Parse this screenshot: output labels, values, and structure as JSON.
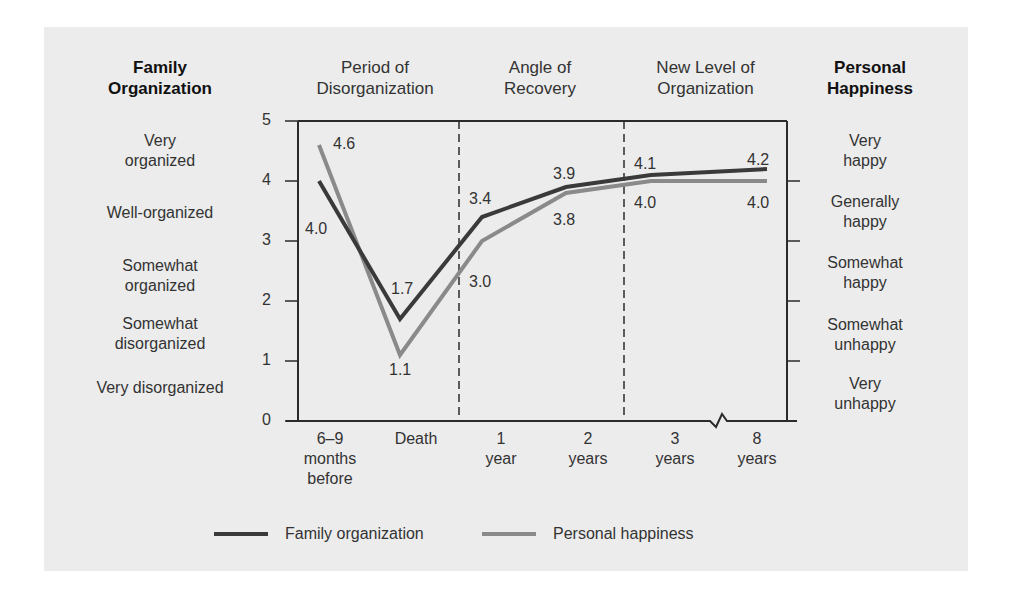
{
  "headers": {
    "left_axis_title": [
      "Family",
      "Organization"
    ],
    "right_axis_title": [
      "Personal",
      "Happiness"
    ],
    "phases": [
      {
        "lines": [
          "Period of",
          "Disorganization"
        ]
      },
      {
        "lines": [
          "Angle of",
          "Recovery"
        ]
      },
      {
        "lines": [
          "New Level of",
          "Organization"
        ]
      }
    ]
  },
  "left_labels": [
    {
      "lines": [
        "Very",
        "organized"
      ]
    },
    {
      "lines": [
        "Well-organized"
      ]
    },
    {
      "lines": [
        "Somewhat",
        "organized"
      ]
    },
    {
      "lines": [
        "Somewhat",
        "disorganized"
      ]
    },
    {
      "lines": [
        "Very disorganized"
      ]
    }
  ],
  "right_labels": [
    {
      "lines": [
        "Very",
        "happy"
      ]
    },
    {
      "lines": [
        "Generally",
        "happy"
      ]
    },
    {
      "lines": [
        "Somewhat",
        "happy"
      ]
    },
    {
      "lines": [
        "Somewhat",
        "unhappy"
      ]
    },
    {
      "lines": [
        "Very",
        "unhappy"
      ]
    }
  ],
  "y_ticks": [
    "0",
    "1",
    "2",
    "3",
    "4",
    "5"
  ],
  "legend": [
    {
      "label": "Family organization",
      "color": "#3a3a3a"
    },
    {
      "label": "Personal happiness",
      "color": "#8a8a8a"
    }
  ],
  "chart_data": {
    "type": "line",
    "title": "",
    "xlabel": "",
    "ylabel": "Family Organization / Personal Happiness",
    "ylim": [
      0,
      5
    ],
    "grid": false,
    "legend_position": "bottom",
    "categories": [
      "6–9 months before",
      "Death",
      "1 year",
      "2 years",
      "3 years",
      "8 years"
    ],
    "category_lines": [
      [
        "6–9",
        "months",
        "before"
      ],
      [
        "Death"
      ],
      [
        "1",
        "year"
      ],
      [
        "2",
        "years"
      ],
      [
        "3",
        "years"
      ],
      [
        "8",
        "years"
      ]
    ],
    "series": [
      {
        "name": "Family organization",
        "color": "#3a3a3a",
        "values": [
          4.0,
          1.7,
          3.4,
          3.9,
          4.1,
          4.2
        ]
      },
      {
        "name": "Personal happiness",
        "color": "#8a8a8a",
        "values": [
          4.6,
          1.1,
          3.0,
          3.8,
          4.0,
          4.0
        ]
      }
    ],
    "annotations": [
      "Period of Disorganization",
      "Angle of Recovery",
      "New Level of Organization"
    ],
    "axis_break_between": [
      "3 years",
      "8 years"
    ]
  }
}
